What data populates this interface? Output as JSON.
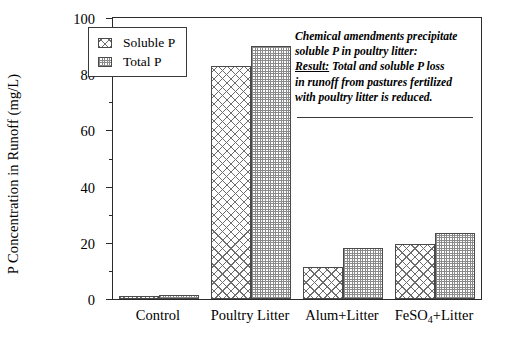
{
  "chart_data": {
    "type": "bar",
    "title": "",
    "xlabel": "",
    "ylabel": "P Concentration in Runoff (mg/L)",
    "ylim": [
      0,
      100
    ],
    "ytick_labels": [
      "0",
      "20",
      "40",
      "60",
      "80",
      "100"
    ],
    "ytick_values": [
      0,
      20,
      40,
      60,
      80,
      100
    ],
    "yminor_values": [
      10,
      30,
      50,
      70,
      90
    ],
    "grid": false,
    "legend_position": "upper-left-inside",
    "categories": [
      "Control",
      "Poultry Litter",
      "Alum+Litter",
      "FeSO4+Litter"
    ],
    "category_labels_html": [
      "Control",
      "Poultry Litter",
      "Alum+Litter",
      "FeSO<sub>4</sub>+Litter"
    ],
    "series": [
      {
        "name": "Soluble P",
        "pattern": "diagonal-crosshatch",
        "values": [
          1.2,
          83,
          11.5,
          19.5
        ]
      },
      {
        "name": "Total P",
        "pattern": "fine-checker-dots",
        "values": [
          1.5,
          90,
          18,
          23.5
        ]
      }
    ],
    "annotations": [
      "Chemical amendments precipitate",
      "soluble P in poultry litter:",
      "Result:  Total and soluble P loss",
      "in  runoff from pastures fertilized",
      "with poultry litter is reduced."
    ]
  },
  "annotation": {
    "line1": "Chemical amendments precipitate",
    "line2": "soluble P in poultry litter:",
    "result_label": "Result:",
    "line3_rest": "  Total and soluble P loss",
    "line4": "in  runoff from pastures fertilized",
    "line5": "with poultry litter is reduced."
  },
  "legend": {
    "items": [
      {
        "label": "Soluble P",
        "swatch": "crosshatch-swatch"
      },
      {
        "label": "Total P",
        "swatch": "dotted-swatch"
      }
    ]
  },
  "colors": {
    "axis": "#2b2b2b",
    "bar_edge": "#4a4a4a",
    "hatch": "#6d6d6d",
    "dots": "#8a8a8a",
    "background": "#ffffff"
  }
}
